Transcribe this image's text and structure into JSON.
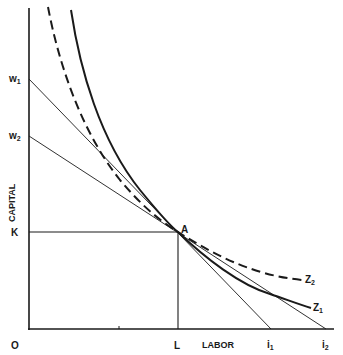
{
  "diagram": {
    "type": "isoquant_isocost_diagram",
    "axes": {
      "x_label": "LABOR",
      "y_label": "CAPITAL",
      "origin_label": "O"
    },
    "points": {
      "equilibrium": "A",
      "capital_level": "K",
      "labor_level": "L"
    },
    "intercepts": {
      "y": [
        "w1",
        "w2"
      ],
      "x": [
        "i1",
        "i2"
      ]
    },
    "intercept_labels": {
      "w1_main": "w",
      "w1_sub": "1",
      "w2_main": "w",
      "w2_sub": "2",
      "i1_main": "i",
      "i1_sub": "1",
      "i2_main": "i",
      "i2_sub": "2"
    },
    "curves": [
      {
        "name": "Z1",
        "main": "Z",
        "sub": "1",
        "style": "solid"
      },
      {
        "name": "Z2",
        "main": "Z",
        "sub": "2",
        "style": "dashed"
      }
    ],
    "lines": [
      {
        "from": "w1",
        "to": "i1",
        "style": "thin-solid"
      },
      {
        "from": "w2",
        "to": "i2",
        "style": "thin-solid"
      }
    ],
    "colors": {
      "ink": "#1a1a1a",
      "background": "#ffffff"
    }
  }
}
